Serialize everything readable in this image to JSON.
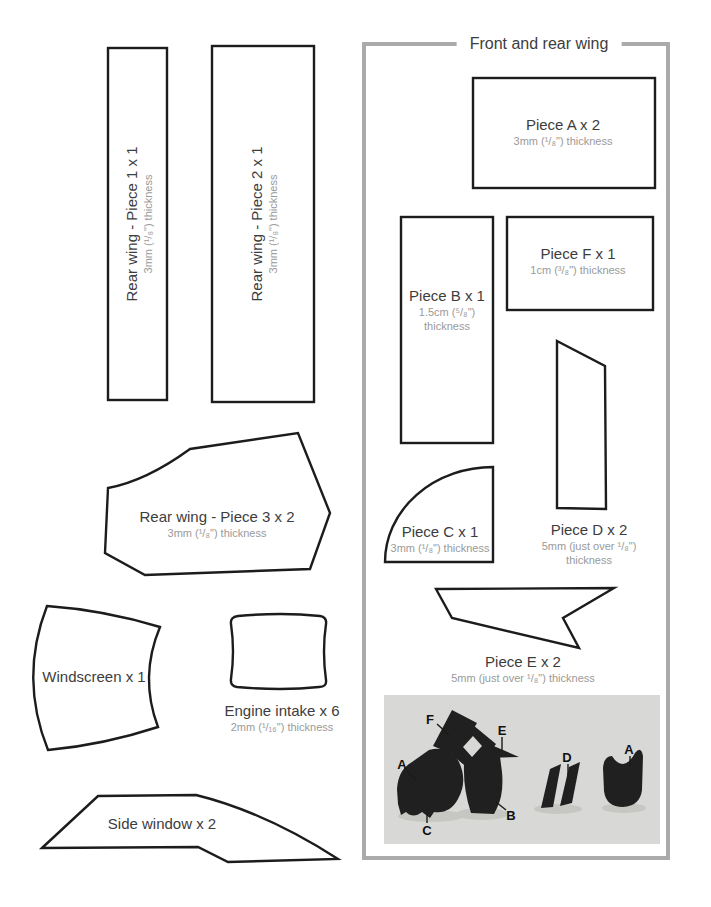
{
  "colors": {
    "panel_border": "#ababab",
    "shape_outline": "#1c1c1c",
    "title_text": "#3d3d3d",
    "sub_text": "#9a9a9a",
    "photo_background": "#d8d8d6",
    "silhouette": "#202020"
  },
  "left_column": {
    "rear_wing_piece1": {
      "title": "Rear wing - Piece 1 x 1",
      "thickness": "3mm (¹/₈\") thickness"
    },
    "rear_wing_piece2": {
      "title": "Rear wing - Piece 2 x 1",
      "thickness": "3mm (¹/₈\") thickness"
    },
    "rear_wing_piece3": {
      "title": "Rear wing - Piece 3 x 2",
      "thickness": "3mm (¹/₈\") thickness"
    },
    "windscreen": {
      "title": "Windscreen x 1"
    },
    "engine_intake": {
      "title": "Engine intake x 6",
      "thickness": "2mm (¹/₁₆\") thickness"
    },
    "side_window": {
      "title": "Side window x 2"
    }
  },
  "panel": {
    "title": "Front and rear wing",
    "piece_a": {
      "title": "Piece A x 2",
      "thickness": "3mm (¹/₈\") thickness"
    },
    "piece_b": {
      "title": "Piece B x 1",
      "thickness_line1": "1.5cm (⁵/₈\")",
      "thickness_line2": "thickness"
    },
    "piece_f": {
      "title": "Piece F x 1",
      "thickness": "1cm (³/₈\") thickness"
    },
    "piece_c": {
      "title": "Piece C x 1",
      "thickness": "3mm (¹/₈\") thickness"
    },
    "piece_d": {
      "title": "Piece D x 2",
      "thickness_line1": "5mm (just over ¹/₈\")",
      "thickness_line2": "thickness"
    },
    "piece_e": {
      "title": "Piece E x 2",
      "thickness": "5mm (just over ¹/₈\") thickness"
    },
    "photo": {
      "label_f": "F",
      "label_e": "E",
      "label_a_left": "A",
      "label_d": "D",
      "label_a_right": "A",
      "label_b": "B",
      "label_c": "C"
    }
  }
}
